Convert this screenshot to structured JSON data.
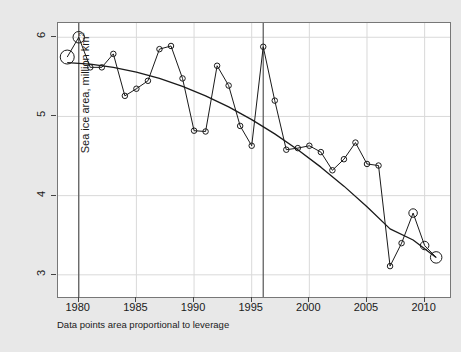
{
  "chart_data": {
    "type": "scatter",
    "title": "",
    "xlabel": "",
    "ylabel": "Sea ice area, million km",
    "ylabel_superscript": "2",
    "caption": "Data points area proportional to leverage",
    "xlim": [
      1978.2,
      2012.2
    ],
    "ylim": [
      2.72,
      6.18
    ],
    "xticks": [
      1980,
      1985,
      1990,
      1995,
      2000,
      2005,
      2010
    ],
    "xticklabels": [
      "1980",
      "1985",
      "1990",
      "1995",
      "2000",
      "2005",
      "2010"
    ],
    "yticks": [
      3,
      4,
      5,
      6
    ],
    "yticklabels": [
      "3",
      "4",
      "5",
      "6"
    ],
    "grid": true,
    "grid_color": "#d9d9d9",
    "legend": "none",
    "point_color": "#1a1a1a",
    "point_fill": "none",
    "line_color": "#1a1a1a",
    "fit_color": "#1a1a1a",
    "panel_background": "#ffffff",
    "figure_background": "#e8e8e8",
    "series": [
      {
        "name": "Sea ice area",
        "x": [
          1979,
          1980,
          1981,
          1982,
          1983,
          1984,
          1985,
          1986,
          1987,
          1988,
          1989,
          1990,
          1991,
          1992,
          1993,
          1994,
          1995,
          1996,
          1997,
          1998,
          1999,
          2000,
          2001,
          2002,
          2003,
          2004,
          2005,
          2006,
          2007,
          2008,
          2009,
          2010,
          2011
        ],
        "y": [
          5.75,
          6.0,
          5.62,
          5.62,
          5.79,
          5.26,
          5.35,
          5.45,
          5.85,
          5.89,
          5.48,
          4.82,
          4.81,
          5.64,
          5.39,
          4.88,
          4.63,
          5.88,
          5.2,
          4.58,
          4.6,
          4.63,
          4.55,
          4.32,
          4.46,
          4.67,
          4.4,
          4.38,
          3.11,
          3.4,
          3.78,
          3.37,
          3.22
        ],
        "leverage_sizes": [
          14,
          11.5,
          5.5,
          5.5,
          5.5,
          5.5,
          5.5,
          5.5,
          5.5,
          5.5,
          5.5,
          5.5,
          5.5,
          5.5,
          5.5,
          5.5,
          5.5,
          5.5,
          5.5,
          5.5,
          5.5,
          5.5,
          5.5,
          5.5,
          5.5,
          5.5,
          5.5,
          5.5,
          5.5,
          5.5,
          8.5,
          8.5,
          11.5
        ]
      }
    ],
    "fit_curve": {
      "name": "quadratic trend",
      "x": [
        1979,
        1981,
        1983,
        1985,
        1987,
        1989,
        1991,
        1993,
        1995,
        1997,
        1999,
        2001,
        2003,
        2005,
        2007,
        2009,
        2011
      ],
      "y": [
        5.68,
        5.66,
        5.62,
        5.56,
        5.48,
        5.38,
        5.26,
        5.12,
        4.96,
        4.78,
        4.58,
        4.36,
        4.12,
        3.86,
        3.58,
        3.44,
        3.22
      ]
    },
    "reference_lines": [
      {
        "name": "vline-1980",
        "x": 1980,
        "orientation": "vertical",
        "color": "#555555"
      },
      {
        "name": "vline-1996",
        "x": 1996,
        "orientation": "vertical",
        "color": "#555555"
      }
    ]
  }
}
